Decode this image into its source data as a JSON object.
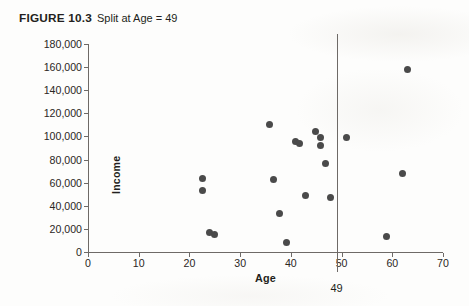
{
  "figure": {
    "label": "FIGURE 10.3",
    "caption": "Split at Age = 49"
  },
  "chart_data": {
    "type": "scatter",
    "title": "Split at Age = 49",
    "xlabel": "Age",
    "ylabel": "Income",
    "xlim": [
      0,
      70
    ],
    "ylim": [
      0,
      180000
    ],
    "xticks": [
      "0",
      "10",
      "20",
      "30",
      "40",
      "50",
      "60",
      "70"
    ],
    "xtick_values": [
      0,
      10,
      20,
      30,
      40,
      50,
      60,
      70
    ],
    "yticks": [
      "0",
      "20,000",
      "40,000",
      "60,000",
      "80,000",
      "100,000",
      "120,000",
      "140,000",
      "160,000",
      "180,000"
    ],
    "ytick_values": [
      0,
      20000,
      40000,
      60000,
      80000,
      100000,
      120000,
      140000,
      160000,
      180000
    ],
    "grid": false,
    "legend": null,
    "marker_color": "#4a4a4a",
    "points": [
      {
        "x": 22.5,
        "y": 64000
      },
      {
        "x": 22.5,
        "y": 53000
      },
      {
        "x": 24.0,
        "y": 17000
      },
      {
        "x": 25.0,
        "y": 15000
      },
      {
        "x": 35.7,
        "y": 110000
      },
      {
        "x": 36.5,
        "y": 63000
      },
      {
        "x": 37.8,
        "y": 33000
      },
      {
        "x": 39.2,
        "y": 8000
      },
      {
        "x": 41.0,
        "y": 96000
      },
      {
        "x": 41.8,
        "y": 94000
      },
      {
        "x": 42.8,
        "y": 49000
      },
      {
        "x": 44.8,
        "y": 104000
      },
      {
        "x": 45.8,
        "y": 99000
      },
      {
        "x": 45.8,
        "y": 92000
      },
      {
        "x": 46.8,
        "y": 77000
      },
      {
        "x": 47.8,
        "y": 47000
      },
      {
        "x": 51.0,
        "y": 99000
      },
      {
        "x": 58.8,
        "y": 13000
      },
      {
        "x": 62.0,
        "y": 68000
      },
      {
        "x": 63.0,
        "y": 158000
      }
    ],
    "annotations": [
      {
        "name": "split-line",
        "type": "vline",
        "x": 49,
        "label": "49"
      }
    ]
  }
}
